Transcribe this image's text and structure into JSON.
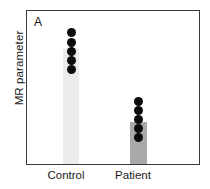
{
  "figure": {
    "panel_label": "A",
    "ylabel": "MR parameter",
    "frame_color": "#3a3a3a",
    "background": "#ffffff"
  },
  "chart_data": {
    "type": "bar",
    "title": "",
    "subtitle": "",
    "panel": "A",
    "xlabel": "",
    "ylabel": "MR parameter",
    "categories": [
      "Control",
      "Patient"
    ],
    "values": [
      74,
      27
    ],
    "ylim": [
      0,
      100
    ],
    "grid": false,
    "legend": null,
    "legend_position": "none",
    "axis_ticks": {
      "y_tick_labels": [],
      "x_tick_labels": [
        "Control",
        "Patient"
      ]
    },
    "bar_colors": [
      "#ececec",
      "#a9a9a9"
    ],
    "overlay": {
      "type": "scatter",
      "marker": "filled-circle",
      "marker_color": "#0b0b0b",
      "series": [
        {
          "name": "Control",
          "n": 5,
          "values": [
            88,
            82,
            76,
            71,
            66
          ]
        },
        {
          "name": "Patient",
          "n": 5,
          "values": [
            40,
            34,
            28,
            23,
            17
          ]
        }
      ]
    },
    "annotations": [
      {
        "text": "A",
        "position": "top-left"
      }
    ]
  },
  "dots": {
    "control": [
      {
        "bottom": 127
      },
      {
        "bottom": 117
      },
      {
        "bottom": 108
      },
      {
        "bottom": 99
      },
      {
        "bottom": 90
      }
    ],
    "patient": [
      {
        "bottom": 58
      },
      {
        "bottom": 49
      },
      {
        "bottom": 40
      },
      {
        "bottom": 31
      },
      {
        "bottom": 22
      }
    ]
  }
}
